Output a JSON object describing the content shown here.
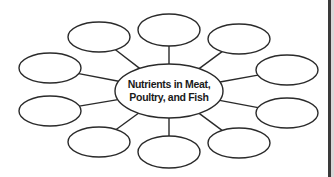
{
  "diagram": {
    "type": "concept-web",
    "center": {
      "line1": "Nutrients in Meat,",
      "line2": "Poultry, and Fish",
      "cx": 169,
      "cy": 91,
      "rx": 54,
      "ry": 27
    },
    "nodes": [
      {
        "id": "top-center",
        "cx": 169,
        "cy": 30,
        "rx": 31,
        "ry": 16,
        "text": ""
      },
      {
        "id": "top-right",
        "cx": 239,
        "cy": 39,
        "rx": 31,
        "ry": 15,
        "text": ""
      },
      {
        "id": "right-top",
        "cx": 287,
        "cy": 70,
        "rx": 31,
        "ry": 15,
        "text": ""
      },
      {
        "id": "right-bottom",
        "cx": 287,
        "cy": 113,
        "rx": 31,
        "ry": 15,
        "text": ""
      },
      {
        "id": "bottom-right",
        "cx": 239,
        "cy": 143,
        "rx": 31,
        "ry": 15,
        "text": ""
      },
      {
        "id": "bottom-center",
        "cx": 169,
        "cy": 152,
        "rx": 31,
        "ry": 16,
        "text": ""
      },
      {
        "id": "bottom-left",
        "cx": 99,
        "cy": 142,
        "rx": 31,
        "ry": 15,
        "text": ""
      },
      {
        "id": "left-bottom",
        "cx": 50,
        "cy": 111,
        "rx": 31,
        "ry": 15,
        "text": ""
      },
      {
        "id": "left-top",
        "cx": 50,
        "cy": 68,
        "rx": 31,
        "ry": 15,
        "text": ""
      },
      {
        "id": "top-left",
        "cx": 99,
        "cy": 37,
        "rx": 31,
        "ry": 15,
        "text": ""
      }
    ],
    "colors": {
      "stroke": "#2a2a2a",
      "background": "#ffffff",
      "border": "#3a3a3a"
    }
  }
}
